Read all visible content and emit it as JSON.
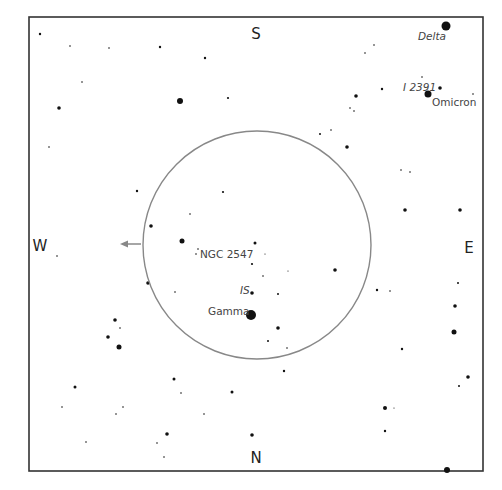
{
  "chart": {
    "frame": {
      "x": 29,
      "y": 17,
      "width": 454,
      "height": 454,
      "stroke": "#333333"
    },
    "field_circle": {
      "cx": 257,
      "cy": 245,
      "r": 114,
      "stroke": "#888888"
    },
    "arrow": {
      "x1": 141,
      "y1": 244,
      "x2": 120,
      "y2": 244,
      "color": "#888888"
    },
    "directions": {
      "north": {
        "text": "N",
        "x": 256,
        "y": 463
      },
      "south": {
        "text": "S",
        "x": 256,
        "y": 39
      },
      "east": {
        "text": "E",
        "x": 469,
        "y": 253
      },
      "west": {
        "text": "W",
        "x": 40,
        "y": 251
      }
    },
    "labels": [
      {
        "text": "Delta",
        "x": 418,
        "y": 40,
        "italic": true
      },
      {
        "text": "I 2391",
        "x": 403,
        "y": 91,
        "italic": true
      },
      {
        "text": "Omicron",
        "x": 432,
        "y": 106,
        "italic": false
      },
      {
        "text": "NGC 2547",
        "x": 200,
        "y": 258,
        "italic": false
      },
      {
        "text": "IS",
        "x": 240,
        "y": 294,
        "italic": true
      },
      {
        "text": "Gamma",
        "x": 208,
        "y": 315,
        "italic": false
      }
    ],
    "stars": [
      [
        446,
        26,
        4.5
      ],
      [
        428,
        94,
        3.5
      ],
      [
        440,
        88,
        1.8
      ],
      [
        422,
        77,
        0.8
      ],
      [
        473,
        94,
        0.8
      ],
      [
        382,
        89,
        1.2
      ],
      [
        356,
        96,
        1.8
      ],
      [
        350,
        108,
        0.8
      ],
      [
        354,
        111,
        0.8
      ],
      [
        320,
        134,
        1
      ],
      [
        331,
        130,
        0.8
      ],
      [
        347,
        147,
        1.8
      ],
      [
        374,
        45,
        0.8
      ],
      [
        365,
        53,
        0.8
      ],
      [
        405,
        210,
        1.8
      ],
      [
        460,
        210,
        1.8
      ],
      [
        401,
        170,
        0.8
      ],
      [
        410,
        172,
        0.8
      ],
      [
        40,
        34,
        1.2
      ],
      [
        70,
        46,
        0.8
      ],
      [
        109,
        48,
        0.8
      ],
      [
        160,
        47,
        1.2
      ],
      [
        205,
        58,
        1.2
      ],
      [
        228,
        98,
        1.1
      ],
      [
        180,
        101,
        3
      ],
      [
        59,
        108,
        1.8
      ],
      [
        82,
        82,
        0.8
      ],
      [
        49,
        147,
        0.8
      ],
      [
        137,
        191,
        1.2
      ],
      [
        223,
        192,
        1.1
      ],
      [
        151,
        226,
        1.8
      ],
      [
        182,
        241,
        2.5
      ],
      [
        190,
        214,
        0.8
      ],
      [
        57,
        256,
        0.8
      ],
      [
        148,
        283,
        1.8
      ],
      [
        175,
        292,
        0.8
      ],
      [
        115,
        320,
        1.8
      ],
      [
        120,
        328,
        0.8
      ],
      [
        108,
        337,
        1.8
      ],
      [
        119,
        347,
        2.5
      ],
      [
        75,
        387,
        1.5
      ],
      [
        62,
        407,
        0.8
      ],
      [
        174,
        379,
        1.5
      ],
      [
        181,
        393,
        0.8
      ],
      [
        232,
        392,
        1.5
      ],
      [
        123,
        407,
        0.8
      ],
      [
        116,
        414,
        0.8
      ],
      [
        204,
        414,
        0.8
      ],
      [
        167,
        434,
        1.8
      ],
      [
        86,
        442,
        0.8
      ],
      [
        157,
        443,
        0.8
      ],
      [
        164,
        457,
        0.8
      ],
      [
        252,
        264,
        1.1
      ],
      [
        263,
        276,
        0.8
      ],
      [
        252,
        293,
        1.8
      ],
      [
        278,
        294,
        1
      ],
      [
        251,
        315,
        5
      ],
      [
        278,
        328,
        1.8
      ],
      [
        268,
        341,
        1
      ],
      [
        287,
        348,
        0.8
      ],
      [
        335,
        270,
        1.8
      ],
      [
        288,
        271,
        0.6
      ],
      [
        265,
        254,
        0.6
      ],
      [
        255,
        243,
        1.5
      ],
      [
        198,
        249,
        0.8
      ],
      [
        196,
        254,
        0.8
      ],
      [
        377,
        290,
        1.2
      ],
      [
        390,
        291,
        0.8
      ],
      [
        455,
        306,
        1.8
      ],
      [
        454,
        332,
        2.5
      ],
      [
        402,
        349,
        1.2
      ],
      [
        458,
        283,
        1
      ],
      [
        468,
        377,
        1.8
      ],
      [
        459,
        386,
        1
      ],
      [
        385,
        408,
        2
      ],
      [
        394,
        408,
        0.6
      ],
      [
        385,
        431,
        1.2
      ],
      [
        447,
        470,
        3
      ],
      [
        252,
        435,
        1.8
      ],
      [
        284,
        371,
        1.2
      ]
    ]
  }
}
